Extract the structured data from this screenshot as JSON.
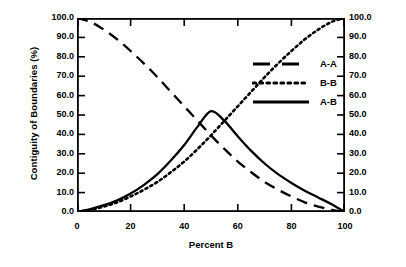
{
  "chart_data": {
    "type": "line",
    "title": "",
    "xlabel": "Percent B",
    "ylabel": "Contiguity of Boundaries (%)",
    "ylabel_right": "Contiguity of Boundaries (%)",
    "xlim": [
      0,
      100
    ],
    "ylim": [
      0,
      100
    ],
    "xticks": [
      0,
      20,
      40,
      60,
      80,
      100
    ],
    "xtick_labels": [
      "0",
      "20",
      "40",
      "60",
      "80",
      "100"
    ],
    "yticks": [
      0,
      10,
      20,
      30,
      40,
      50,
      60,
      70,
      80,
      90,
      100
    ],
    "ytick_labels": [
      "0.0",
      "10.0",
      "20.0",
      "30.0",
      "40.0",
      "50.0",
      "60.0",
      "70.0",
      "80.0",
      "90.0",
      "100.0"
    ],
    "ytick_labels_right": [
      "0.0",
      "10.0",
      "20.0",
      "30.0",
      "40.0",
      "50.0",
      "60.0",
      "70.0",
      "80.0",
      "90.0",
      "100.0"
    ],
    "grid": false,
    "legend_position": "upper-center",
    "tick_direction": "in",
    "frame": "box",
    "x": [
      0,
      5,
      10,
      15,
      20,
      25,
      30,
      35,
      40,
      45,
      50,
      55,
      60,
      65,
      70,
      75,
      80,
      85,
      90,
      95,
      100
    ],
    "series": [
      {
        "name": "A-A",
        "style": "dashed",
        "color": "#000000",
        "values": [
          100.0,
          98.0,
          94.0,
          89.0,
          83.0,
          76.5,
          69.5,
          62.0,
          54.5,
          47.0,
          39.5,
          32.5,
          26.0,
          20.5,
          15.5,
          11.5,
          8.0,
          5.0,
          2.8,
          1.1,
          0.0
        ]
      },
      {
        "name": "B-B",
        "style": "dotted",
        "color": "#000000",
        "values": [
          0.0,
          1.1,
          2.8,
          5.0,
          8.0,
          11.5,
          15.5,
          20.5,
          26.0,
          32.5,
          39.5,
          47.0,
          54.5,
          62.0,
          69.5,
          76.5,
          83.0,
          89.0,
          94.0,
          98.0,
          100.0
        ]
      },
      {
        "name": "A-B",
        "style": "solid",
        "color": "#000000",
        "values": [
          0.0,
          1.5,
          3.5,
          6.0,
          9.5,
          14.0,
          19.5,
          26.5,
          34.5,
          44.0,
          52.0,
          47.0,
          39.0,
          31.5,
          25.0,
          19.5,
          15.0,
          11.0,
          7.5,
          4.0,
          0.0
        ]
      }
    ]
  },
  "legend": {
    "items": [
      {
        "label": "A-A",
        "style": "dashed"
      },
      {
        "label": "B-B",
        "style": "dotted"
      },
      {
        "label": "A-B",
        "style": "solid"
      }
    ]
  }
}
